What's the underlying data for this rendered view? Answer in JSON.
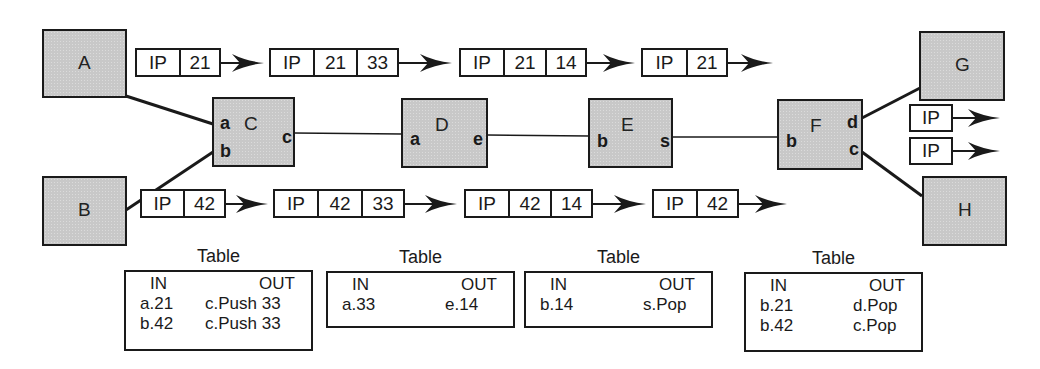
{
  "diagram": {
    "colors": {
      "node_fill": "#c8c8c8",
      "stroke": "#1a1a1a",
      "packet_fill": "#ffffff"
    },
    "nodes": [
      {
        "id": "A",
        "label": "A",
        "x": 42,
        "y": 29,
        "w": 85,
        "h": 69,
        "ports": []
      },
      {
        "id": "B",
        "label": "B",
        "x": 42,
        "y": 176,
        "w": 85,
        "h": 70,
        "ports": []
      },
      {
        "id": "C",
        "label": "C",
        "x": 212,
        "y": 97,
        "w": 83,
        "h": 70,
        "ports": [
          {
            "label": "a",
            "dx": 6,
            "dy": 14
          },
          {
            "label": "b",
            "dx": 6,
            "dy": 42
          },
          {
            "label": "c",
            "dx": 68,
            "dy": 28
          }
        ]
      },
      {
        "id": "D",
        "label": "D",
        "x": 401,
        "y": 98,
        "w": 87,
        "h": 70,
        "ports": [
          {
            "label": "a",
            "dx": 7,
            "dy": 29
          },
          {
            "label": "e",
            "dx": 70,
            "dy": 29
          }
        ]
      },
      {
        "id": "E",
        "label": "E",
        "x": 588,
        "y": 98,
        "w": 85,
        "h": 70,
        "ports": [
          {
            "label": "b",
            "dx": 7,
            "dy": 31
          },
          {
            "label": "s",
            "dx": 70,
            "dy": 31
          }
        ]
      },
      {
        "id": "F",
        "label": "F",
        "x": 777,
        "y": 99,
        "w": 86,
        "h": 71,
        "ports": [
          {
            "label": "b",
            "dx": 7,
            "dy": 30
          },
          {
            "label": "d",
            "dx": 68,
            "dy": 11
          },
          {
            "label": "c",
            "dx": 70,
            "dy": 38
          }
        ]
      },
      {
        "id": "G",
        "label": "G",
        "x": 919,
        "y": 31,
        "w": 86,
        "h": 70,
        "ports": []
      },
      {
        "id": "H",
        "label": "H",
        "x": 922,
        "y": 176,
        "w": 85,
        "h": 70,
        "ports": []
      }
    ],
    "links": [
      {
        "from": "A",
        "to": "C.a",
        "x1": 126,
        "y1": 96,
        "x2": 213,
        "y2": 124,
        "width": 3
      },
      {
        "from": "B",
        "to": "C.b",
        "x1": 126,
        "y1": 210,
        "x2": 213,
        "y2": 152,
        "width": 3
      },
      {
        "from": "C.c",
        "to": "D.a",
        "x1": 294,
        "y1": 133,
        "x2": 402,
        "y2": 134,
        "width": 1.6
      },
      {
        "from": "D.e",
        "to": "E.b",
        "x1": 487,
        "y1": 135,
        "x2": 589,
        "y2": 136,
        "width": 1.6
      },
      {
        "from": "E.s",
        "to": "F.b",
        "x1": 672,
        "y1": 137,
        "x2": 778,
        "y2": 137,
        "width": 1.6
      },
      {
        "from": "F.d",
        "to": "G",
        "x1": 862,
        "y1": 118,
        "x2": 920,
        "y2": 88,
        "width": 3
      },
      {
        "from": "F.c",
        "to": "H",
        "x1": 862,
        "y1": 152,
        "x2": 922,
        "y2": 196,
        "width": 3
      }
    ],
    "packets_top": [
      {
        "x": 135,
        "y": 48,
        "cells": [
          "IP",
          "21"
        ],
        "widths": [
          44,
          42
        ],
        "arrow_to": 264
      },
      {
        "x": 269,
        "y": 48,
        "cells": [
          "IP",
          "21",
          "33"
        ],
        "widths": [
          44,
          43,
          43
        ],
        "arrow_to": 452
      },
      {
        "x": 459,
        "y": 48,
        "cells": [
          "IP",
          "21",
          "14"
        ],
        "widths": [
          44,
          42,
          42
        ],
        "arrow_to": 635
      },
      {
        "x": 641,
        "y": 48,
        "cells": [
          "IP",
          "21"
        ],
        "widths": [
          45,
          42
        ],
        "arrow_to": 773
      }
    ],
    "packets_bottom": [
      {
        "x": 140,
        "y": 189,
        "cells": [
          "IP",
          "42"
        ],
        "widths": [
          43,
          43
        ],
        "arrow_to": 268
      },
      {
        "x": 273,
        "y": 189,
        "cells": [
          "IP",
          "42",
          "33"
        ],
        "widths": [
          44,
          44,
          44
        ],
        "arrow_to": 457
      },
      {
        "x": 464,
        "y": 189,
        "cells": [
          "IP",
          "42",
          "14"
        ],
        "widths": [
          44,
          42,
          43
        ],
        "arrow_to": 646
      },
      {
        "x": 652,
        "y": 189,
        "cells": [
          "IP",
          "42"
        ],
        "widths": [
          44,
          43
        ],
        "arrow_to": 787
      }
    ],
    "packets_exit": [
      {
        "x": 909,
        "y": 104,
        "cells": [
          "IP"
        ],
        "widths": [
          44
        ],
        "h": 28,
        "arrow_to": 1000
      },
      {
        "x": 909,
        "y": 137,
        "cells": [
          "IP"
        ],
        "widths": [
          44
        ],
        "h": 28,
        "arrow_to": 1000
      }
    ],
    "tables": [
      {
        "caption": "Table",
        "node": "C",
        "x": 124,
        "y": 270,
        "w": 189,
        "h": 81,
        "header": {
          "in": "IN",
          "out": "OUT"
        },
        "rows": [
          {
            "in": "a.21",
            "out": "c.Push 33"
          },
          {
            "in": "b.42",
            "out": "c.Push 33"
          }
        ]
      },
      {
        "caption": "Table",
        "node": "D",
        "x": 326,
        "y": 271,
        "w": 189,
        "h": 57,
        "header": {
          "in": "IN",
          "out": "OUT"
        },
        "rows": [
          {
            "in": "a.33",
            "out": "e.14"
          }
        ]
      },
      {
        "caption": "Table",
        "node": "E",
        "x": 524,
        "y": 271,
        "w": 189,
        "h": 57,
        "header": {
          "in": "IN",
          "out": "OUT"
        },
        "rows": [
          {
            "in": "b.14",
            "out": "s.Pop"
          }
        ]
      },
      {
        "caption": "Table",
        "node": "F",
        "x": 744,
        "y": 272,
        "w": 179,
        "h": 80,
        "header": {
          "in": "IN",
          "out": "OUT"
        },
        "rows": [
          {
            "in": "b.21",
            "out": "d.Pop"
          },
          {
            "in": "b.42",
            "out": "c.Pop"
          }
        ]
      }
    ]
  }
}
